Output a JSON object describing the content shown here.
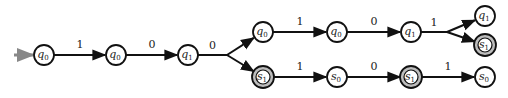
{
  "diagram": {
    "type": "automaton-run-tree",
    "colors": {
      "stroke": "#111111",
      "start_arrow": "#888888",
      "accept_fill": "#bdbdbd",
      "node_fill": "#ffffff"
    },
    "nodes": [
      {
        "id": "n0",
        "name": "q",
        "sub": "0",
        "x": 44,
        "y": 55,
        "accepting": false,
        "start": true
      },
      {
        "id": "n1",
        "name": "q",
        "sub": "0",
        "x": 116,
        "y": 55,
        "accepting": false
      },
      {
        "id": "n2",
        "name": "q",
        "sub": "1",
        "x": 188,
        "y": 55,
        "accepting": false
      },
      {
        "id": "n3",
        "name": "q",
        "sub": "0",
        "x": 263,
        "y": 32,
        "accepting": false
      },
      {
        "id": "n4",
        "name": "s",
        "sub": "1",
        "x": 263,
        "y": 77,
        "accepting": true
      },
      {
        "id": "n5",
        "name": "q",
        "sub": "0",
        "x": 337,
        "y": 32,
        "accepting": false
      },
      {
        "id": "n6",
        "name": "s",
        "sub": "0",
        "x": 337,
        "y": 77,
        "accepting": false
      },
      {
        "id": "n7",
        "name": "q",
        "sub": "1",
        "x": 411,
        "y": 32,
        "accepting": false
      },
      {
        "id": "n8",
        "name": "s",
        "sub": "1",
        "x": 411,
        "y": 77,
        "accepting": true
      },
      {
        "id": "n9",
        "name": "q",
        "sub": "1",
        "x": 485,
        "y": 16,
        "accepting": false
      },
      {
        "id": "n10",
        "name": "s",
        "sub": "1",
        "x": 485,
        "y": 45,
        "accepting": true
      },
      {
        "id": "n11",
        "name": "s",
        "sub": "0",
        "x": 485,
        "y": 77,
        "accepting": false
      }
    ],
    "edges": [
      {
        "from": "n0",
        "to": "n1",
        "label": "1"
      },
      {
        "from": "n1",
        "to": "n2",
        "label": "0"
      },
      {
        "from": "n2",
        "to": [
          "n3",
          "n4"
        ],
        "label": "0",
        "branch_x": 227
      },
      {
        "from": "n3",
        "to": "n5",
        "label": "1"
      },
      {
        "from": "n5",
        "to": "n7",
        "label": "0"
      },
      {
        "from": "n7",
        "to": [
          "n9",
          "n10"
        ],
        "label": "1",
        "branch_x": 447
      },
      {
        "from": "n4",
        "to": "n6",
        "label": "1"
      },
      {
        "from": "n6",
        "to": "n8",
        "label": "0"
      },
      {
        "from": "n8",
        "to": "n11",
        "label": "1"
      }
    ]
  }
}
